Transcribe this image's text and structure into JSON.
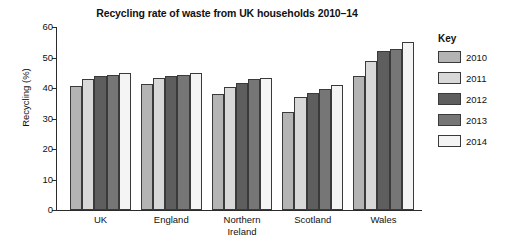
{
  "chart_data": {
    "type": "bar",
    "title": "Recycling rate of waste from UK households 2010–14",
    "xlabel": "",
    "ylabel": "Recycling (%)",
    "ylim": [
      0,
      60
    ],
    "ytick_step": 10,
    "yticks": [
      0,
      10,
      20,
      30,
      40,
      50,
      60
    ],
    "grid": false,
    "legend_title": "Key",
    "legend_position": "right",
    "categories": [
      "UK",
      "England",
      "Northern\nIreland",
      "Scotland",
      "Wales"
    ],
    "series": [
      {
        "name": "2010",
        "color": "#b4b4b4",
        "values": [
          40.5,
          41.3,
          38.0,
          32.2,
          44.0
        ]
      },
      {
        "name": "2011",
        "color": "#d8d8d8",
        "values": [
          43.0,
          43.3,
          40.2,
          37.2,
          49.0
        ]
      },
      {
        "name": "2012",
        "color": "#5e5e5e",
        "values": [
          44.0,
          44.0,
          41.8,
          38.5,
          52.0
        ]
      },
      {
        "name": "2013",
        "color": "#767676",
        "values": [
          44.3,
          44.3,
          43.0,
          39.8,
          52.7
        ]
      },
      {
        "name": "2014",
        "color": "#f4f4f4",
        "values": [
          45.0,
          45.0,
          43.3,
          41.0,
          55.0
        ]
      }
    ]
  },
  "colors": {
    "axis": "#2b2b2b",
    "bar_outline": "#3a3a3a",
    "text": "#111111",
    "background": "#ffffff"
  }
}
